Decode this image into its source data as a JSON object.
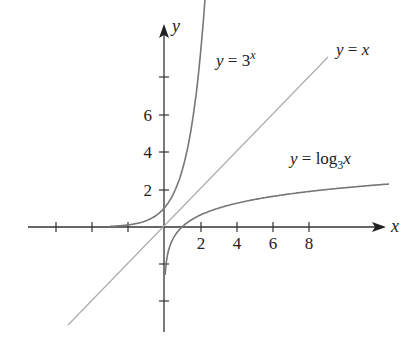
{
  "chart_data": {
    "type": "line",
    "title": "",
    "xlabel": "x",
    "ylabel": "y",
    "xlim": [
      -7.5,
      12
    ],
    "ylim": [
      -5.5,
      10.8
    ],
    "grid": false,
    "x_ticks": [
      -6,
      -4,
      -2,
      2,
      4,
      6,
      8
    ],
    "x_tick_labels": [
      "2",
      "4",
      "6",
      "8"
    ],
    "y_ticks": [
      -4,
      -2,
      2,
      4,
      6,
      8
    ],
    "y_tick_labels": [
      "2",
      "4",
      "6"
    ],
    "series": [
      {
        "name": "y = 3^x",
        "function": "3^x",
        "x_range": [
          -3,
          2.4
        ],
        "color": "#777777"
      },
      {
        "name": "y = x",
        "function": "x",
        "x_range": [
          -5.3,
          9.7
        ],
        "color": "#aaaaaa"
      },
      {
        "name": "y = log_3 x",
        "function": "log3(x)",
        "x_range": [
          0.06,
          12.5
        ],
        "color": "#777777"
      }
    ],
    "annotations": [
      {
        "text": "y = 3^x",
        "position": "near top of exponential curve"
      },
      {
        "text": "y = x",
        "position": "upper right end of identity line"
      },
      {
        "text": "y = log_3 x",
        "position": "above logarithm curve on right"
      }
    ]
  },
  "labels": {
    "x_axis": "x",
    "y_axis": "y",
    "exp": {
      "pre": "y = 3",
      "sup": "x"
    },
    "identity": "y = x",
    "log": {
      "pre": "y = log",
      "sub": "3",
      "post": "x"
    }
  }
}
